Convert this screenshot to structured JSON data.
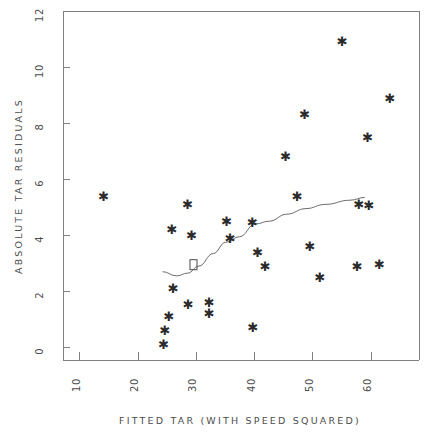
{
  "chart_data": {
    "type": "scatter",
    "title": "",
    "xlabel": "FITTED TAR (WITH SPEED SQUARED)",
    "ylabel": "ABSOLUTE TAR RESIDUALS",
    "xlim": [
      7.1,
      68.2
    ],
    "ylim": [
      -0.45,
      12.0
    ],
    "xticks": [
      10,
      20,
      30,
      40,
      50,
      60
    ],
    "xtick_labels": [
      "10",
      "20",
      "30",
      "40",
      "50",
      "60"
    ],
    "yticks": [
      0,
      2,
      4,
      6,
      8,
      10,
      12
    ],
    "ytick_labels": [
      "0",
      "2",
      "4",
      "6",
      "8",
      "10",
      "12"
    ],
    "grid": false,
    "legend": null,
    "marker": "star-asterisk",
    "series": [
      {
        "name": "absolute tar residuals",
        "marker": "*",
        "points": [
          {
            "x": 14.1,
            "y": 5.4
          },
          {
            "x": 25.8,
            "y": 4.2
          },
          {
            "x": 26.0,
            "y": 2.1
          },
          {
            "x": 25.3,
            "y": 1.1
          },
          {
            "x": 24.6,
            "y": 0.6
          },
          {
            "x": 24.4,
            "y": 0.1
          },
          {
            "x": 28.5,
            "y": 5.1
          },
          {
            "x": 29.2,
            "y": 4.0
          },
          {
            "x": 28.6,
            "y": 1.55
          },
          {
            "x": 32.2,
            "y": 1.6
          },
          {
            "x": 32.2,
            "y": 1.2
          },
          {
            "x": 35.2,
            "y": 4.5
          },
          {
            "x": 35.8,
            "y": 3.9
          },
          {
            "x": 39.6,
            "y": 4.45
          },
          {
            "x": 39.7,
            "y": 0.7
          },
          {
            "x": 40.5,
            "y": 3.4
          },
          {
            "x": 41.8,
            "y": 2.9
          },
          {
            "x": 45.3,
            "y": 6.8
          },
          {
            "x": 47.3,
            "y": 5.4
          },
          {
            "x": 48.6,
            "y": 8.3
          },
          {
            "x": 49.5,
            "y": 3.6
          },
          {
            "x": 51.2,
            "y": 2.5
          },
          {
            "x": 55.0,
            "y": 10.9
          },
          {
            "x": 57.9,
            "y": 5.1
          },
          {
            "x": 59.6,
            "y": 5.05
          },
          {
            "x": 57.6,
            "y": 2.9
          },
          {
            "x": 59.4,
            "y": 7.5
          },
          {
            "x": 61.4,
            "y": 2.95
          },
          {
            "x": 63.2,
            "y": 8.9
          }
        ]
      },
      {
        "name": "overlapping-pair-marker",
        "marker": "box",
        "points": [
          {
            "x": 29.5,
            "y": 2.95
          }
        ]
      }
    ],
    "smooth_line": {
      "name": "lowess smooth",
      "points": [
        {
          "x": 24.2,
          "y": 2.7
        },
        {
          "x": 26.6,
          "y": 2.55
        },
        {
          "x": 28.5,
          "y": 2.65
        },
        {
          "x": 30.4,
          "y": 2.9
        },
        {
          "x": 32.9,
          "y": 3.35
        },
        {
          "x": 35.0,
          "y": 3.75
        },
        {
          "x": 37.4,
          "y": 3.95
        },
        {
          "x": 40.1,
          "y": 4.4
        },
        {
          "x": 42.5,
          "y": 4.5
        },
        {
          "x": 45.5,
          "y": 4.75
        },
        {
          "x": 48.8,
          "y": 4.95
        },
        {
          "x": 52.1,
          "y": 5.1
        },
        {
          "x": 56.4,
          "y": 5.25
        },
        {
          "x": 58.9,
          "y": 5.35
        }
      ]
    }
  }
}
